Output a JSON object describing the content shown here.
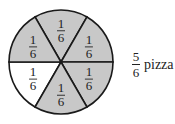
{
  "diagram": {
    "type": "fraction-circle",
    "slices_total": 6,
    "slice_label": {
      "numerator": "1",
      "denominator": "6"
    },
    "shaded_count": 5,
    "unshaded_slice_index": 3,
    "colors": {
      "shaded": "#c8c8c8",
      "unshaded": "#ffffff",
      "stroke": "#1a1a1a"
    }
  },
  "caption": {
    "numerator": "5",
    "denominator": "6",
    "text": "pizza"
  }
}
